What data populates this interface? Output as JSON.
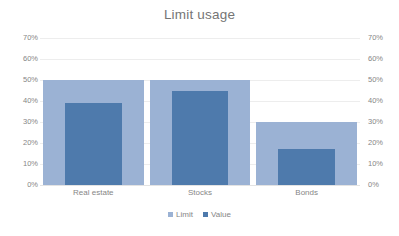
{
  "chart_data": {
    "type": "bar",
    "title": "Limit usage",
    "xlabel": "",
    "ylabel": "",
    "ylim": [
      0,
      70
    ],
    "grid": true,
    "legend_position": "bottom",
    "dual_axis": true,
    "categories": [
      "Real estate",
      "Stocks",
      "Bonds"
    ],
    "ytick_labels": [
      "70%",
      "60%",
      "50%",
      "40%",
      "30%",
      "20%",
      "10%",
      "0%"
    ],
    "ytick_values": [
      70,
      60,
      50,
      40,
      30,
      20,
      10,
      0
    ],
    "ytick_labels_right": [
      "70%",
      "60%",
      "50%",
      "40%",
      "30%",
      "20%",
      "10%",
      "0%"
    ],
    "series": [
      {
        "name": "Limit",
        "color": "#9bb2d4",
        "values": [
          50,
          50,
          30
        ]
      },
      {
        "name": "Value",
        "color": "#4e7aac",
        "values": [
          39,
          45,
          17
        ]
      }
    ]
  },
  "legend": {
    "items": [
      {
        "label": "Limit",
        "color": "#9bb2d4"
      },
      {
        "label": "Value",
        "color": "#4e7aac"
      }
    ]
  }
}
